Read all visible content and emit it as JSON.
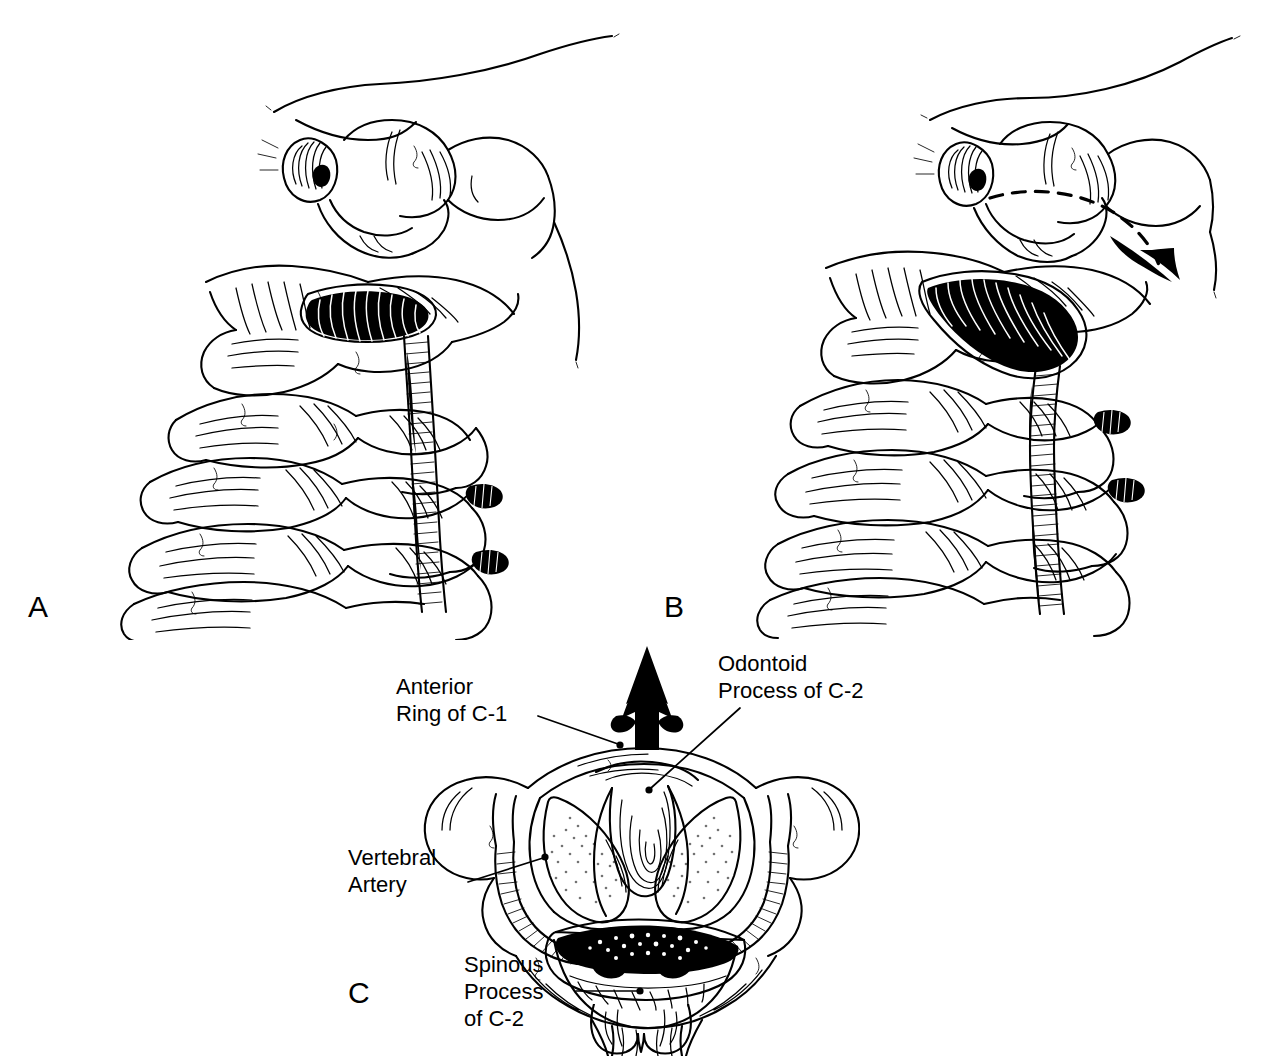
{
  "figure": {
    "background_color": "#ffffff",
    "ink_color": "#000000",
    "width": 1268,
    "height": 1056
  },
  "panels": [
    {
      "id": "A",
      "letter": "A",
      "view": "lateral-oblique",
      "description": "Lateral oblique view of the upper cervical spine in neutral position with the vertebral artery coursing through the transverse foramina",
      "has_motion_arrow": false
    },
    {
      "id": "B",
      "letter": "B",
      "view": "lateral-oblique-rotated",
      "description": "Same lateral oblique view with the head rotated; a dashed curved arrow indicates the direction of rotation and resulting vertebral artery stretch",
      "has_motion_arrow": true,
      "motion_arrow": {
        "name": "rotation-arrow",
        "style": "dashed-curved",
        "direction": "down-right"
      }
    },
    {
      "id": "C",
      "letter": "C",
      "view": "axial-superior",
      "description": "Axial superior view of the C1-C2 complex showing the odontoid process, anterior ring of C-1, vertebral arteries and the spinous process of C-2",
      "has_motion_arrow": true,
      "motion_arrow": {
        "name": "anterior-direction-arrow",
        "style": "solid-black",
        "direction": "up"
      }
    }
  ],
  "callouts": [
    {
      "name": "anterior-ring-of-c1",
      "text": "Anterior\nRing of C-1",
      "lines": [
        "Anterior",
        "Ring of C-1"
      ],
      "target": "anterior arch of the atlas"
    },
    {
      "name": "odontoid-process-of-c2",
      "text": "Odontoid\nProcess of C-2",
      "lines": [
        "Odontoid",
        "Process of C-2"
      ],
      "target": "dens of the axis"
    },
    {
      "name": "vertebral-artery",
      "text": "Vertebral\nArtery",
      "lines": [
        "Vertebral",
        "Artery"
      ],
      "target": "vertebral artery in the transverse foramen"
    },
    {
      "name": "spinous-process-of-c2",
      "text": "Spinous\nProcess\nof C-2",
      "lines": [
        "Spinous",
        "Process",
        "of C-2"
      ],
      "target": "bifid spinous process of the axis"
    }
  ]
}
